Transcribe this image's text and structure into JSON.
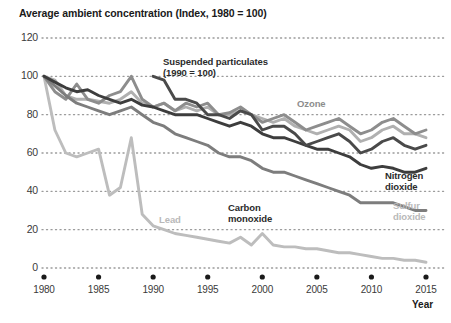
{
  "title": "Average ambient concentration (Index, 1980 = 100)",
  "axis": {
    "x_name": "Year",
    "y_ticks": [
      "120",
      "100",
      "80",
      "60",
      "40",
      "20",
      "0"
    ],
    "x_ticks": [
      "1980",
      "1985",
      "1990",
      "1995",
      "2000",
      "2005",
      "2010",
      "2015"
    ]
  },
  "colors": {
    "suspended_particulates": "#4a4a4a",
    "nitrogen_dioxide": "#3d3d3d",
    "ozone": "#8d8d8d",
    "carbon_monoxide": "#7d7d7d",
    "sulfur_dioxide": "#b0b0b0",
    "lead": "#bdbdbd",
    "grid": "#9a9a9a",
    "axis_dot": "#1a1a1a",
    "text": "#1a1a1a"
  },
  "labels": {
    "suspended_particulates_line1": "Suspended particulates",
    "suspended_particulates_line2": "(1990 = 100)",
    "ozone": "Ozone",
    "nitrogen_dioxide_line1": "Nitrogen",
    "nitrogen_dioxide_line2": "dioxide",
    "sulfur_dioxide_line1": "Sulfur",
    "sulfur_dioxide_line2": "dioxide",
    "carbon_monoxide_line1": "Carbon",
    "carbon_monoxide_line2": "monoxide",
    "lead": "Lead"
  },
  "chart_data": {
    "type": "line",
    "title": "Average ambient concentration (Index, 1980 = 100)",
    "xlabel": "Year",
    "ylabel": "Average ambient concentration (Index, 1980 = 100)",
    "xlim": [
      1980,
      2015
    ],
    "ylim": [
      0,
      120
    ],
    "grid": true,
    "grid_style": "dotted-horizontal",
    "legend_position": "inline-annotations",
    "x": [
      1980,
      1981,
      1982,
      1983,
      1984,
      1985,
      1986,
      1987,
      1988,
      1989,
      1990,
      1991,
      1992,
      1993,
      1994,
      1995,
      1996,
      1997,
      1998,
      1999,
      2000,
      2001,
      2002,
      2003,
      2004,
      2005,
      2006,
      2007,
      2008,
      2009,
      2010,
      2011,
      2012,
      2013,
      2014,
      2015
    ],
    "series": [
      {
        "name": "Ozone",
        "color": "#8d8d8d",
        "values": [
          100,
          92,
          88,
          96,
          88,
          86,
          90,
          92,
          100,
          88,
          84,
          86,
          82,
          86,
          84,
          86,
          80,
          81,
          84,
          80,
          76,
          78,
          80,
          76,
          72,
          74,
          76,
          78,
          74,
          70,
          72,
          76,
          78,
          74,
          70,
          72
        ]
      },
      {
        "name": "Nitrogen dioxide",
        "color": "#3d3d3d",
        "values": [
          100,
          97,
          94,
          92,
          93,
          90,
          88,
          86,
          88,
          85,
          84,
          82,
          80,
          80,
          80,
          78,
          76,
          74,
          76,
          74,
          70,
          68,
          68,
          66,
          64,
          62,
          62,
          60,
          58,
          54,
          52,
          53,
          52,
          50,
          50,
          52
        ]
      },
      {
        "name": "Sulfur dioxide",
        "color": "#b0b0b0",
        "values": [
          100,
          98,
          90,
          88,
          88,
          87,
          86,
          88,
          92,
          86,
          84,
          86,
          82,
          84,
          82,
          84,
          80,
          80,
          82,
          80,
          78,
          76,
          78,
          74,
          72,
          70,
          72,
          74,
          72,
          66,
          68,
          72,
          74,
          70,
          70,
          68
        ]
      },
      {
        "name": "Suspended particulates",
        "color": "#4a4a4a",
        "note": "1990 = 100",
        "values": [
          null,
          null,
          null,
          null,
          null,
          null,
          null,
          null,
          null,
          null,
          100,
          98,
          88,
          88,
          86,
          80,
          80,
          78,
          82,
          80,
          72,
          74,
          74,
          70,
          64,
          66,
          68,
          70,
          66,
          60,
          62,
          66,
          68,
          64,
          62,
          64
        ]
      },
      {
        "name": "Carbon monoxide",
        "color": "#7d7d7d",
        "values": [
          100,
          95,
          90,
          86,
          84,
          82,
          80,
          82,
          84,
          80,
          76,
          74,
          70,
          68,
          66,
          64,
          60,
          58,
          58,
          56,
          52,
          50,
          50,
          48,
          46,
          44,
          42,
          40,
          38,
          34,
          34,
          34,
          34,
          32,
          30,
          30
        ]
      },
      {
        "name": "Lead",
        "color": "#bdbdbd",
        "values": [
          100,
          72,
          60,
          58,
          60,
          62,
          38,
          42,
          68,
          28,
          22,
          20,
          18,
          17,
          16,
          15,
          14,
          13,
          16,
          12,
          18,
          12,
          11,
          11,
          10,
          10,
          9,
          8,
          8,
          7,
          6,
          5,
          5,
          4,
          4,
          3
        ]
      }
    ]
  }
}
